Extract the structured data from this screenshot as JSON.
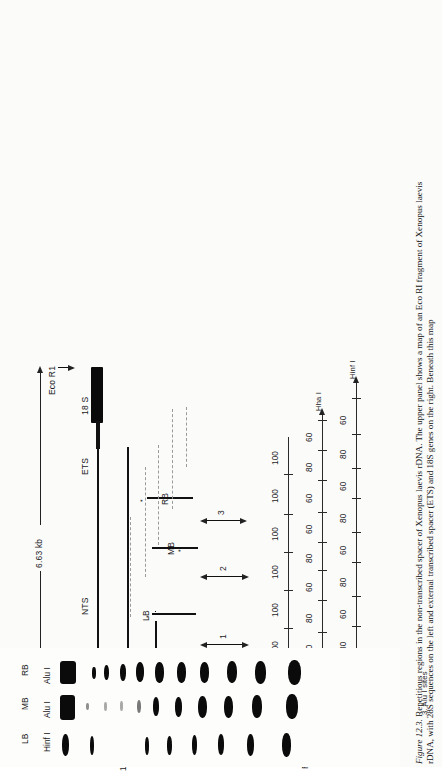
{
  "figure": {
    "number": "Figure 12.3.",
    "caption_line1": "Repetitious regions in the non-transcribed spacer of Xenopus laevis rDNA. The upper panel shows a map of an Eco RI fragment of Xenopus laevis",
    "caption_line2": "rDNA, with 28S sequences on the left and external transcribed spacer (ETS) and 18S genes on the right. Beneath this map",
    "species_italic": "Xenopus laevis",
    "figure_label_italic": "12.3."
  },
  "map": {
    "scale_label": "6.63 kb",
    "ecoR1_left": "Eco R1",
    "ecoR1_right": "Eco R1",
    "segments": [
      {
        "name": "28 S"
      },
      {
        "name": "NTS"
      },
      {
        "name": "ETS"
      },
      {
        "name": "18 S"
      }
    ],
    "row_labels": [
      "18 S rDNA insert of pXL 108",
      "L/Hind III",
      "M/Hha I",
      "R/Hinf I",
      "Repetitious regions"
    ],
    "clone_labels": [
      "LB",
      "MB",
      "RB"
    ],
    "region_numbers": [
      "1",
      "2",
      "3"
    ]
  },
  "repeat_panel": {
    "group_label": "Repetitious regions",
    "rows": [
      {
        "name": "LB",
        "enzyme": "Bam HI",
        "end_enzyme": "",
        "legend": "1. Hinf I sites",
        "tick_values": [
          "100",
          "100",
          "100",
          "100",
          "100",
          "100"
        ]
      },
      {
        "name": "MB",
        "enzyme": "Bam HI",
        "end_enzyme": "Hha I",
        "legend": "2. Alu I sites",
        "tick_values": [
          "60",
          "80",
          "60",
          "80",
          "60",
          "60",
          "80",
          "60",
          "80"
        ]
      },
      {
        "name": "RB",
        "enzyme": "Bam HI",
        "end_enzyme": "Hinf I",
        "legend": "3. Alu I sites",
        "tick_values": [
          "80",
          "60",
          "80",
          "60",
          "80",
          "60",
          "80",
          "60"
        ]
      }
    ]
  },
  "gel": {
    "lanes": [
      {
        "name": "LB",
        "enzyme": "Hinf I"
      },
      {
        "name": "MB",
        "enzyme": "Alu I"
      },
      {
        "name": "RB",
        "enzyme": "Alu I"
      }
    ]
  },
  "colors": {
    "ink": "#111111",
    "paper": "#fbfbfa",
    "dash": "#9a9a9a"
  }
}
